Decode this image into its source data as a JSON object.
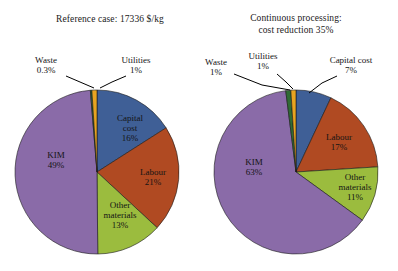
{
  "figure": {
    "background": "#ffffff",
    "charts": [
      {
        "id": "reference-case",
        "title": "Reference case: 17336 $/kg",
        "center": {
          "x": 97,
          "y": 172
        },
        "radius": 82,
        "chart_data": {
          "type": "pie",
          "title": "Reference case: 17336 $/kg",
          "start_angle_deg": 0,
          "direction": "clockwise",
          "categories": [
            "Capital cost",
            "Labour",
            "Other materials",
            "KIM",
            "Waste",
            "Utilities"
          ],
          "values": [
            16,
            21,
            13,
            49,
            0.3,
            1
          ],
          "value_labels": [
            "16%",
            "21%",
            "13%",
            "49%",
            "0.3%",
            "1%"
          ],
          "colors": [
            "#3f5f96",
            "#b04a22",
            "#9bbc3e",
            "#8a6ba8",
            "#2f6b34",
            "#e8a421"
          ],
          "legend": "none"
        },
        "inner_labels": [
          {
            "name": "capital-cost",
            "lines": [
              "Capital",
              "cost",
              "16%"
            ],
            "x": 130,
            "y": 129
          },
          {
            "name": "labour",
            "lines": [
              "Labour",
              "21%"
            ],
            "x": 153,
            "y": 178
          },
          {
            "name": "other-materials",
            "lines": [
              "Other",
              "materials",
              "13%"
            ],
            "x": 120,
            "y": 216
          },
          {
            "name": "kim",
            "lines": [
              "KIM",
              "49%"
            ],
            "x": 56,
            "y": 161
          }
        ],
        "callouts": [
          {
            "name": "waste",
            "lines": [
              "Waste",
              "0.3%"
            ],
            "x": 46,
            "y": 66,
            "leader": "M 66 76 L 80 82 L 94 88"
          },
          {
            "name": "utilities",
            "lines": [
              "Utilities",
              "1%"
            ],
            "x": 136,
            "y": 66,
            "leader": "M 126 76 L 112 82 L 100 88"
          }
        ]
      },
      {
        "id": "continuous-processing",
        "title": "Continuous processing:\ncost reduction 35%",
        "center": {
          "x": 296,
          "y": 172
        },
        "radius": 82,
        "chart_data": {
          "type": "pie",
          "title": "Continuous processing: cost reduction 35%",
          "start_angle_deg": 0,
          "direction": "clockwise",
          "categories": [
            "Capital cost",
            "Labour",
            "Other materials",
            "KIM",
            "Waste",
            "Utilities"
          ],
          "values": [
            7,
            17,
            11,
            63,
            1,
            1
          ],
          "value_labels": [
            "7%",
            "17%",
            "11%",
            "63%",
            "1%",
            "1%"
          ],
          "colors": [
            "#3f5f96",
            "#b04a22",
            "#9bbc3e",
            "#8a6ba8",
            "#2f6b34",
            "#e8a421"
          ],
          "legend": "none"
        },
        "inner_labels": [
          {
            "name": "labour",
            "lines": [
              "Labour",
              "17%"
            ],
            "x": 339,
            "y": 143
          },
          {
            "name": "other-materials",
            "lines": [
              "Other",
              "materials",
              "11%"
            ],
            "x": 355,
            "y": 188
          },
          {
            "name": "kim",
            "lines": [
              "KIM",
              "63%"
            ],
            "x": 254,
            "y": 168
          }
        ],
        "callouts": [
          {
            "name": "waste",
            "lines": [
              "Waste",
              "1%"
            ],
            "x": 216,
            "y": 68,
            "leader": "M 234 74 L 262 85 L 290 90"
          },
          {
            "name": "utilities",
            "lines": [
              "Utilities",
              "1%"
            ],
            "x": 263,
            "y": 62,
            "leader": "M 277 74 L 286 82 L 293 89"
          },
          {
            "name": "capital-cost",
            "lines": [
              "Capital cost",
              "7%"
            ],
            "x": 351,
            "y": 66,
            "leader": "M 337 76 L 322 83 L 309 93"
          }
        ]
      }
    ]
  }
}
